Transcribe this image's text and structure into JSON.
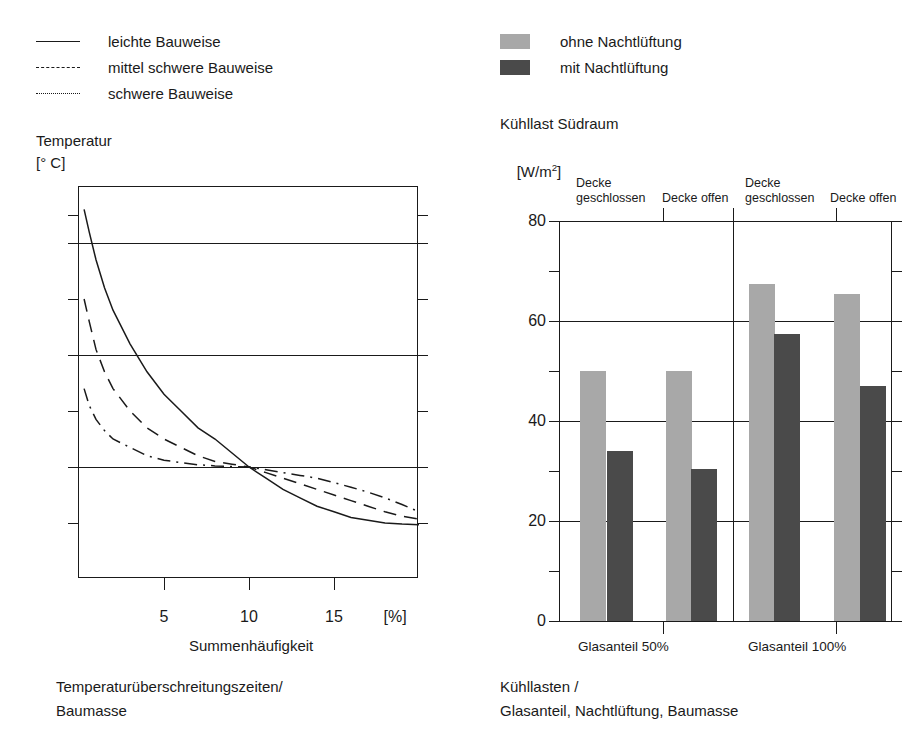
{
  "legend_left": {
    "items": [
      {
        "label": "leichte Bauweise",
        "style": "solid"
      },
      {
        "label": "mittel schwere Bauweise",
        "style": "dashed"
      },
      {
        "label": "schwere Bauweise",
        "style": "dash-dot"
      }
    ]
  },
  "legend_right": {
    "items": [
      {
        "label": "ohne Nachtlüftung",
        "color": "#a8a8a8"
      },
      {
        "label": "mit Nachtlüftung",
        "color": "#4a4a4a"
      }
    ]
  },
  "left_chart": {
    "axis_title_line1": "Temperatur",
    "axis_title_line2": "[° C]",
    "x_unit": "[%]",
    "xlabel": "Summenhäufigkeit",
    "caption_line1": "Temperaturüberschreitungszeiten/",
    "caption_line2": "Baumasse",
    "y_ticks_major": [
      "29",
      "27",
      "25",
      "23"
    ],
    "x_ticks_major": [
      "5",
      "10",
      "15"
    ]
  },
  "right_chart": {
    "axis_title_line1": "Kühllast Südraum",
    "axis_title_line2_pre": "[W/m",
    "axis_title_line2_sup": "2",
    "axis_title_line2_post": "]",
    "caption_line1": "Kühllasten /",
    "caption_line2": "Glasanteil, Nachtlüftung, Baumasse",
    "group_labels": [
      "Decke\ngeschlossen",
      "Decke offen",
      "Decke\ngeschlossen",
      "Decke offen"
    ],
    "base_labels": [
      "Glasanteil 50%",
      "Glasanteil 100%"
    ],
    "y_ticks_major": [
      "80",
      "60",
      "40",
      "20",
      "0"
    ]
  },
  "chart_data": [
    {
      "type": "line",
      "title": "Temperaturüberschreitungszeiten/Baumasse",
      "xlabel": "Summenhäufigkeit",
      "x_unit": "[%]",
      "ylabel": "Temperatur",
      "y_unit": "[° C]",
      "xlim": [
        0,
        20
      ],
      "ylim": [
        23,
        30
      ],
      "xticks_major": [
        5,
        10,
        15
      ],
      "yticks_major": [
        23,
        25,
        27,
        29
      ],
      "yticks_minor": [
        24,
        26,
        28,
        29.5
      ],
      "grid": true,
      "legend_position": "above-left",
      "series": [
        {
          "name": "leichte Bauweise",
          "style": "solid",
          "x": [
            0.3,
            0.6,
            1,
            1.5,
            2,
            3,
            4,
            5,
            6,
            7,
            8,
            9,
            10,
            11,
            12,
            13,
            14,
            15,
            16,
            17,
            18,
            19,
            20
          ],
          "y": [
            29.6,
            29.2,
            28.7,
            28.2,
            27.8,
            27.2,
            26.7,
            26.3,
            26.0,
            25.7,
            25.5,
            25.25,
            25.0,
            24.8,
            24.6,
            24.45,
            24.3,
            24.2,
            24.1,
            24.05,
            24.0,
            23.98,
            23.97
          ]
        },
        {
          "name": "mittel schwere Bauweise",
          "style": "dashed",
          "x": [
            0.3,
            0.6,
            1,
            1.5,
            2,
            3,
            4,
            5,
            6,
            7,
            8,
            9,
            10,
            11,
            12,
            13,
            14,
            15,
            16,
            17,
            18,
            19,
            20
          ],
          "y": [
            28.0,
            27.6,
            27.1,
            26.7,
            26.4,
            26.0,
            25.7,
            25.5,
            25.35,
            25.2,
            25.1,
            25.05,
            25.0,
            24.9,
            24.8,
            24.7,
            24.6,
            24.5,
            24.4,
            24.3,
            24.2,
            24.12,
            24.07
          ]
        },
        {
          "name": "schwere Bauweise",
          "style": "dash-dot",
          "x": [
            0.3,
            0.6,
            1,
            1.5,
            2,
            3,
            4,
            5,
            6,
            7,
            8,
            9,
            10,
            11,
            12,
            13,
            14,
            15,
            16,
            17,
            18,
            19,
            20
          ],
          "y": [
            26.4,
            26.1,
            25.85,
            25.65,
            25.5,
            25.35,
            25.2,
            25.12,
            25.08,
            25.04,
            25.02,
            25.01,
            25.0,
            24.95,
            24.9,
            24.85,
            24.8,
            24.72,
            24.64,
            24.55,
            24.45,
            24.33,
            24.2
          ]
        }
      ]
    },
    {
      "type": "bar",
      "title": "Kühllasten / Glasanteil, Nachtlüftung, Baumasse",
      "ylabel": "Kühllast Südraum",
      "y_unit": "[W/m²]",
      "ylim": [
        0,
        80
      ],
      "yticks_major": [
        0,
        20,
        40,
        60,
        80
      ],
      "yticks_minor": [
        10,
        30,
        50,
        70
      ],
      "grid": true,
      "categories": [
        "Glasanteil 50% / Decke geschlossen",
        "Glasanteil 50% / Decke offen",
        "Glasanteil 100% / Decke geschlossen",
        "Glasanteil 100% / Decke offen"
      ],
      "series": [
        {
          "name": "ohne Nachtlüftung",
          "color": "#a8a8a8",
          "values": [
            50,
            50,
            67.5,
            65.5
          ]
        },
        {
          "name": "mit Nachtlüftung",
          "color": "#4a4a4a",
          "values": [
            34,
            30.5,
            57.5,
            47
          ]
        }
      ]
    }
  ]
}
